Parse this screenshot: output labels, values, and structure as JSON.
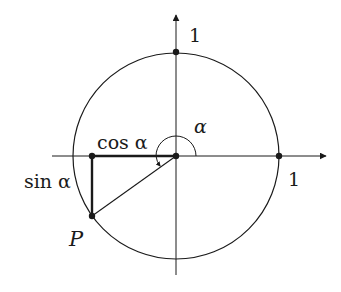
{
  "diagram": {
    "type": "unit-circle",
    "colors": {
      "stroke": "#1a1a1a",
      "background": "#ffffff"
    },
    "labels": {
      "y_axis_one": "1",
      "x_axis_one": "1",
      "alpha": "α",
      "cos": "cos α",
      "sin": "sin α",
      "point": "P"
    }
  }
}
